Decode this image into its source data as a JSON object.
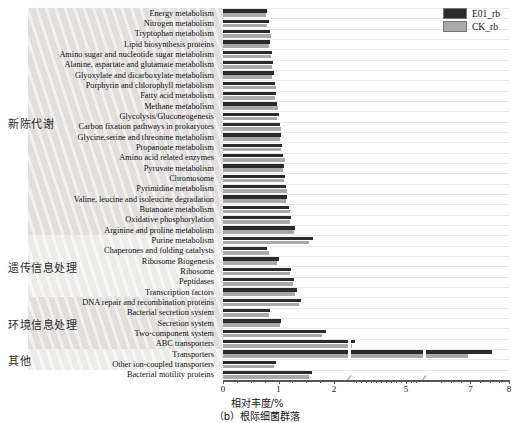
{
  "figure": {
    "caption": "（b）根际细菌群落",
    "xlabel": "相对丰度/%"
  },
  "legend": {
    "position": "top-right",
    "items": [
      {
        "label": "E01_rb",
        "color": "#2b2b2b"
      },
      {
        "label": "CK_rb",
        "color": "#a9a9a9"
      }
    ]
  },
  "groups": [
    {
      "label": "新陈代谢",
      "start": 0,
      "end": 22
    },
    {
      "label": "遗传信息处理",
      "start": 22,
      "end": 28
    },
    {
      "label": "环境信息处理",
      "start": 28,
      "end": 33
    },
    {
      "label": "其他",
      "start": 33,
      "end": 35
    }
  ],
  "chart_data": {
    "type": "bar",
    "orientation": "horizontal",
    "title": "",
    "xlabel": "相对丰度/%",
    "ylabel": "",
    "xlim": [
      0,
      8
    ],
    "xticks": [
      0,
      1,
      2,
      5,
      7,
      8
    ],
    "axis_breaks": [
      2.25,
      5.85
    ],
    "grid": true,
    "legend": [
      "E01_rb",
      "CK_rb"
    ],
    "categories": [
      "Energy metabolism",
      "Nitrogen metabolism",
      "Tryptophan metabolism",
      "Lipid biosynthesis proteins",
      "Amino sugar and nucleotide sugar metabolism",
      "Alanine, aspartate and glutamate metabolism",
      "Glyoxylate and dicarboxylate metabolism",
      "Porphyrin and chlorophyll metabolism",
      "Fatty acid metabolism",
      "Methane metabolism",
      "Glycolysis/Gluconeogenesis",
      "Carbon fixation pathways in prokaryotes",
      "Glycine,serine and threonine metabolism",
      "Propanoate metabolism",
      "Amino acid related enzymes",
      "Pyruvate metabolism",
      "Chromosome",
      "Pyrimidine metabolism",
      "Valine, leucine and isoleucine degradation",
      "Butanoate metabolism",
      "Oxidative phosphorylation",
      "Arginine and proline metabolism",
      "Purine metabolism",
      "Chaperones and folding catalysts",
      "Ribosome Biogenesis",
      "Ribosome",
      "Peptidases",
      "Transcription factors",
      "DNA repair and recombination proteins",
      "Bacterial secretion system",
      "Secretion system",
      "Two-component system",
      "ABC transporters",
      "Transporters",
      "Other ion-coupled transporters",
      "Bacterial motility proteins"
    ],
    "series": [
      {
        "name": "E01_rb",
        "color": "#2b2b2b",
        "values": [
          0.8,
          0.82,
          0.84,
          0.85,
          0.88,
          0.9,
          0.91,
          0.93,
          0.96,
          0.97,
          1.0,
          1.02,
          1.05,
          1.06,
          1.08,
          1.1,
          1.12,
          1.14,
          1.16,
          1.18,
          1.22,
          1.3,
          1.62,
          0.8,
          1.0,
          1.22,
          1.28,
          1.33,
          1.4,
          0.85,
          1.05,
          1.85,
          2.45,
          7.55,
          0.95,
          1.6
        ]
      },
      {
        "name": "CK_rb",
        "color": "#a9a9a9",
        "values": [
          0.78,
          0.8,
          0.86,
          0.83,
          0.86,
          0.88,
          0.89,
          0.95,
          0.94,
          0.99,
          0.98,
          1.04,
          1.03,
          1.04,
          1.12,
          1.08,
          1.1,
          1.16,
          1.14,
          1.2,
          1.2,
          1.28,
          1.55,
          0.82,
          0.98,
          1.2,
          1.26,
          1.3,
          1.37,
          0.82,
          1.02,
          1.78,
          2.3,
          6.95,
          0.92,
          1.55
        ]
      }
    ]
  }
}
